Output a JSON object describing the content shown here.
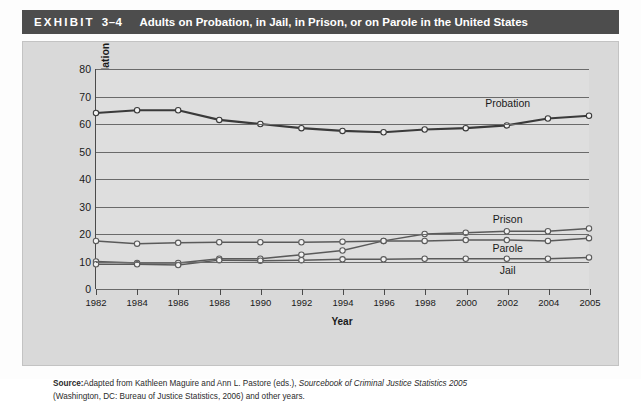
{
  "header": {
    "exhibit_word": "EXHIBIT",
    "exhibit_number": "3–4",
    "title": "Adults on Probation, in Jail, in Prison, or on Parole in the United States",
    "band_color": "#4d4d4d",
    "text_color": "#ffffff"
  },
  "source": {
    "label": "Source:",
    "line1_a": "Adapted from Kathleen Maguire and Ann L. Pastore (eds.), ",
    "line1_italic": "Sourcebook of Criminal Justice Statistics 2005",
    "line2": "(Washington, DC: Bureau of Justice Statistics, 2006) and other years."
  },
  "chart_data": {
    "type": "line",
    "title": "Adults on Probation, in Jail, in Prison, or on Parole in the United States",
    "xlabel": "Year",
    "ylabel": "Percent of Total Correctional Population",
    "x": [
      1982,
      1984,
      1986,
      1988,
      1990,
      1992,
      1994,
      1996,
      1998,
      2000,
      2002,
      2004,
      2005
    ],
    "xtick_labels": [
      "1982",
      "1984",
      "1986",
      "1988",
      "1990",
      "1992",
      "1994",
      "1996",
      "1998",
      "2000",
      "2002",
      "2004",
      "2005"
    ],
    "ylim": [
      0,
      80
    ],
    "ytick_labels": [
      "0",
      "10",
      "20",
      "30",
      "40",
      "50",
      "60",
      "70",
      "80"
    ],
    "yticks": [
      0,
      10,
      20,
      30,
      40,
      50,
      60,
      70,
      80
    ],
    "grid": "horizontal",
    "legend_position": "inline-right",
    "marker": "open-circle",
    "series": [
      {
        "name": "Probation",
        "values": [
          64.0,
          65.0,
          65.0,
          61.5,
          60.0,
          58.5,
          57.5,
          57.0,
          58.0,
          58.5,
          59.5,
          62.0,
          63.0
        ],
        "color": "#3a3a3a",
        "width": 2.2,
        "label_x": 2002,
        "label_y": 67.5
      },
      {
        "name": "Prison",
        "values": [
          10.0,
          9.5,
          9.5,
          11.0,
          11.0,
          12.5,
          14.0,
          17.5,
          20.0,
          20.5,
          21.0,
          21.0,
          22.0
        ],
        "color": "#5a5a5a",
        "width": 1.5,
        "label_x": 2002,
        "label_y": 25.5
      },
      {
        "name": "Parole",
        "values": [
          17.5,
          16.5,
          16.8,
          17.0,
          17.0,
          17.0,
          17.2,
          17.5,
          17.5,
          17.8,
          17.8,
          17.5,
          18.5
        ],
        "color": "#5a5a5a",
        "width": 1.5,
        "label_x": 2002,
        "label_y": 15.0
      },
      {
        "name": "Jail",
        "values": [
          9.0,
          9.0,
          8.7,
          10.5,
          10.3,
          10.5,
          10.8,
          10.8,
          11.0,
          11.0,
          11.0,
          11.0,
          11.5
        ],
        "color": "#5a5a5a",
        "width": 1.5,
        "label_x": 2002,
        "label_y": 7.0
      }
    ]
  }
}
